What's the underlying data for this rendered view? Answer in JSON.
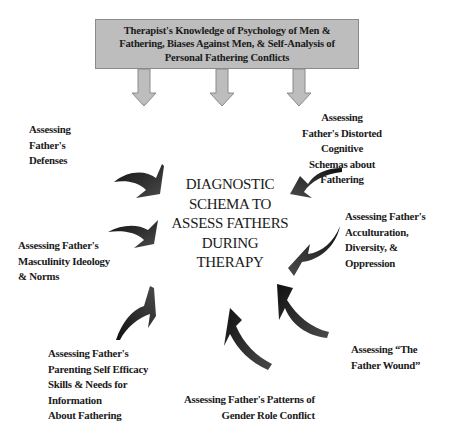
{
  "diagram": {
    "top_box": {
      "lines": [
        "Therapist's Knowledge of Psychology of Men &",
        "Fathering, Biases Against Men, & Self-Analysis of",
        "Personal Fathering Conflicts"
      ],
      "fill_color": "#bdbdbd"
    },
    "center": {
      "lines": [
        "DIAGNOSTIC",
        "SCHEMA TO",
        "ASSESS FATHERS",
        "DURING",
        "THERAPY"
      ]
    },
    "nodes": [
      {
        "id": "defenses",
        "lines": [
          "Assessing",
          "Father's",
          "Defenses"
        ]
      },
      {
        "id": "distorted-schemas",
        "lines": [
          "Assessing",
          "Father's Distorted",
          "Cognitive",
          "Schemas about",
          "Fathering"
        ]
      },
      {
        "id": "acculturation",
        "lines": [
          "Assessing Father's",
          "Acculturation,",
          "Diversity, &",
          "Oppression"
        ]
      },
      {
        "id": "masculinity",
        "lines": [
          "Assessing Father's",
          "Masculinity Ideology",
          "& Norms"
        ]
      },
      {
        "id": "parenting",
        "lines": [
          "Assessing Father's",
          "Parenting Self Efficacy",
          "Skills & Needs for",
          "Information",
          "About Fathering"
        ]
      },
      {
        "id": "father-wound",
        "lines": [
          "Assessing “The",
          "Father Wound”"
        ]
      },
      {
        "id": "gender-role",
        "lines": [
          "Assessing Father's Patterns of",
          "Gender Role Conflict"
        ]
      }
    ],
    "colors": {
      "down_arrow": "#bdbdbd",
      "down_arrow_border": "#8a8a8a",
      "curved_arrow": "#1e1e1e"
    }
  }
}
